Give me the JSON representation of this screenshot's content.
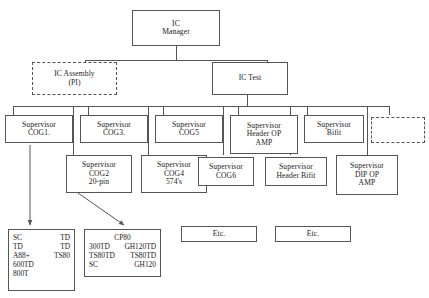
{
  "diagram": {
    "title_nodes": {
      "ic_manager": {
        "line1": "IC",
        "line2": "Manager"
      },
      "ic_assembly": {
        "line1": "IC Assembly",
        "line2": "(PI)"
      },
      "ic_test": {
        "line1": "IC Test"
      }
    },
    "supervisors_row1": [
      {
        "line1": "Supervisor",
        "line2": "COG1."
      },
      {
        "line1": "Supervisor",
        "line2": "COG3."
      },
      {
        "line1": "Supervisor",
        "line2": "COG5"
      },
      {
        "line1": "Supervisor",
        "line2": "Header OP",
        "line3": "AMP"
      },
      {
        "line1": "Supervisor",
        "line2": "Bifit"
      }
    ],
    "supervisors_row2": [
      {
        "line1": "Supervisor",
        "line2": "COG2",
        "line3": "20-pin"
      },
      {
        "line1": "Supervisor",
        "line2": "COG4",
        "line3": "574's"
      },
      {
        "line1": "Supervisor",
        "line2": "COG6"
      },
      {
        "line1": "Supervisor",
        "line2": "Header Bifit"
      },
      {
        "line1": "Supervisor",
        "line2": "DIP OP",
        "line3": "AMP"
      }
    ],
    "placeholder_box": {
      "label": ""
    },
    "detail_box_1": {
      "rows": [
        {
          "c1": "SC",
          "c2": "TD"
        },
        {
          "c1": "TD",
          "c2": "TD"
        },
        {
          "c1": "A88+",
          "c2": "TS80"
        },
        {
          "c1": "600TD",
          "c2": ""
        },
        {
          "c1": "800T",
          "c2": ""
        }
      ]
    },
    "detail_box_2": {
      "header": "CP80",
      "rows": [
        {
          "c1": "300TD",
          "c2": "GH120TD"
        },
        {
          "c1": "TS80TD",
          "c2": "TS80TD"
        },
        {
          "c1": "SC",
          "c2": "GH120"
        }
      ]
    },
    "etc_box_1": {
      "label": "Etc."
    },
    "etc_box_2": {
      "label": "Etc."
    }
  },
  "colors": {
    "stroke": "#555555",
    "text": "#1a1a1a",
    "background": "#ffffff"
  }
}
